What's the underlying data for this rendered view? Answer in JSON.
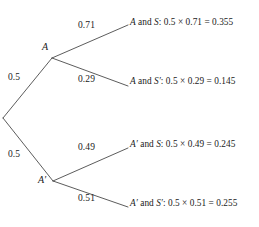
{
  "diagram": {
    "type": "probability-tree",
    "root": {
      "label": "",
      "x": 3,
      "y": 118
    },
    "level1": [
      {
        "id": "A",
        "node_label": "A",
        "probability": "0.5",
        "node_x": 42,
        "node_y": 48,
        "vertex_x": 52,
        "vertex_y": 58,
        "prob_x": 8,
        "prob_y": 78
      },
      {
        "id": "A-prime",
        "node_label": "A′",
        "probability": "0.5",
        "node_x": 40,
        "node_y": 181,
        "vertex_x": 53,
        "vertex_y": 181,
        "prob_x": 8,
        "prob_y": 155
      }
    ],
    "branches": [
      {
        "id": "A-S",
        "parent": "A",
        "probability": "0.71",
        "prob_x": 78,
        "prob_y": 26,
        "end_x": 128,
        "end_y": 25,
        "outcome_event": "A",
        "outcome_event_prime": "",
        "outcome_second": "S",
        "outcome_second_prime": "",
        "outcome_text": "A and S: 0.5 × 0.71 = 0.355",
        "outcome_x": 130,
        "outcome_y": 22,
        "joint_value": "0.355"
      },
      {
        "id": "A-Sprime",
        "parent": "A",
        "probability": "0.29",
        "prob_x": 78,
        "prob_y": 80,
        "end_x": 128,
        "end_y": 86,
        "outcome_event": "A",
        "outcome_event_prime": "",
        "outcome_second": "S",
        "outcome_second_prime": "′",
        "outcome_text": "A and S′: 0.5 × 0.29 = 0.145",
        "outcome_x": 130,
        "outcome_y": 81,
        "joint_value": "0.145"
      },
      {
        "id": "Aprime-S",
        "parent": "A-prime",
        "probability": "0.49",
        "prob_x": 78,
        "prob_y": 148,
        "end_x": 128,
        "end_y": 148,
        "outcome_event": "A",
        "outcome_event_prime": "′",
        "outcome_second": "S",
        "outcome_second_prime": "",
        "outcome_text": "A′ and S: 0.5 × 0.49 = 0.245",
        "outcome_x": 130,
        "outcome_y": 143,
        "joint_value": "0.245"
      },
      {
        "id": "Aprime-Sprime",
        "parent": "A-prime",
        "probability": "0.51",
        "prob_x": 78,
        "prob_y": 199,
        "end_x": 128,
        "end_y": 207,
        "outcome_event": "A",
        "outcome_event_prime": "′",
        "outcome_second": "S",
        "outcome_second_prime": "′",
        "outcome_text": "A′ and S′: 0.5 × 0.51 = 0.255",
        "outcome_x": 130,
        "outcome_y": 202,
        "joint_value": "0.255"
      }
    ],
    "conjunction_word": "and",
    "times_symbol": "×",
    "equals_symbol": "=",
    "colon_symbol": ":",
    "root_probability_shared": "0.5",
    "line_color": "#4a4a4a",
    "text_color": "#1a1a1a",
    "background_color": "#ffffff"
  },
  "chart_data": {
    "type": "diagram",
    "title": "",
    "structure": "two-stage probability tree",
    "stage1_outcomes": [
      "A",
      "A′"
    ],
    "stage1_probabilities": [
      0.5,
      0.5
    ],
    "stage2_outcomes": [
      "S",
      "S′"
    ],
    "conditional_probabilities": {
      "S_given_A": 0.71,
      "Sprime_given_A": 0.29,
      "S_given_Aprime": 0.49,
      "Sprime_given_Aprime": 0.51
    },
    "joint_probabilities": [
      {
        "path": "A and S",
        "computation": "0.5 × 0.71",
        "value": 0.355
      },
      {
        "path": "A and S′",
        "computation": "0.5 × 0.29",
        "value": 0.145
      },
      {
        "path": "A′ and S",
        "computation": "0.5 × 0.49",
        "value": 0.245
      },
      {
        "path": "A′ and S′",
        "computation": "0.5 × 0.51",
        "value": 0.255
      }
    ],
    "total_probability": 1.0
  }
}
